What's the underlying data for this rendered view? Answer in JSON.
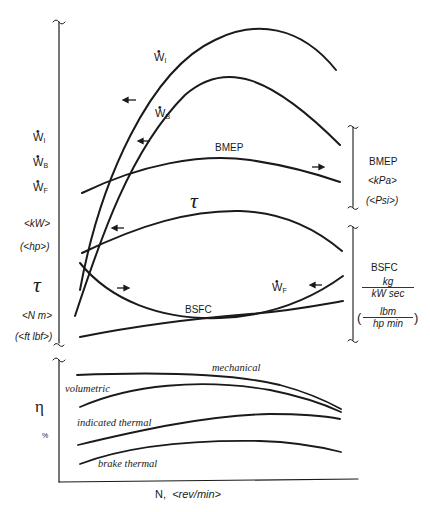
{
  "diagram": {
    "x_axis": {
      "label": "N,",
      "unit": "<rev/min>"
    },
    "left_axis_upper": {
      "power_symbols": [
        "W",
        "W",
        "W"
      ],
      "power_subscripts": [
        "I",
        "B",
        "F"
      ],
      "power_unit_si": "<kW>",
      "power_unit_us": "(<hp>)",
      "torque_symbol": "τ",
      "torque_unit_si": "<N m>",
      "torque_unit_us": "(<ft lbf>)"
    },
    "left_axis_lower": {
      "symbol": "η",
      "unit": "%"
    },
    "right_axis_bmep": {
      "label": "BMEP",
      "unit_si": "<kPa>",
      "unit_us": "(<Psi>)"
    },
    "right_axis_bsfc": {
      "label": "BSFC",
      "si_num": "kg",
      "si_den": "kW sec",
      "us_num": "lbm",
      "us_den": "hp min"
    },
    "curve_labels": {
      "indicated_power": {
        "symbol": "W",
        "sub": "I"
      },
      "brake_power": {
        "symbol": "W",
        "sub": "B"
      },
      "friction_power": {
        "symbol": "W",
        "sub": "F"
      },
      "bmep": "BMEP",
      "torque": "τ",
      "bsfc": "BSFC"
    },
    "efficiency_labels": {
      "mechanical": "mechanical",
      "volumetric": "volumetric",
      "indicated_thermal": "indicated thermal",
      "brake_thermal": "brake thermal"
    },
    "break_symbol": "~"
  }
}
